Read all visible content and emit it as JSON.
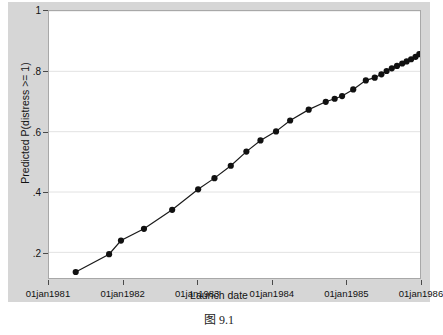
{
  "figure": {
    "caption": "图 9.1"
  },
  "chart_data": {
    "type": "line",
    "title": "",
    "xlabel": "Launch date",
    "ylabel": "Predicted P(distress >= 1)",
    "grid": true,
    "grid_axis": "y",
    "legend": "none",
    "marker": "filled-circle",
    "line_color": "#1a1a1a",
    "marker_color": "#111111",
    "xlim": [
      "01jan1981",
      "01jan1986"
    ],
    "ylim": [
      0.115,
      1.0
    ],
    "xtick_labels": [
      "01jan1981",
      "01jan1982",
      "01jan1983",
      "01jan1984",
      "01jan1985",
      "01jan1986"
    ],
    "xtick_positions": [
      1981.0,
      1982.0,
      1983.0,
      1984.0,
      1985.0,
      1986.0
    ],
    "ytick_labels": [
      ".2",
      ".4",
      ".6",
      ".8",
      "1"
    ],
    "ytick_values": [
      0.2,
      0.4,
      0.6,
      0.8,
      1.0
    ],
    "x": [
      1981.36,
      1981.81,
      1981.97,
      1982.28,
      1982.66,
      1983.01,
      1983.23,
      1983.45,
      1983.66,
      1983.85,
      1984.06,
      1984.25,
      1984.5,
      1984.73,
      1984.85,
      1984.95,
      1985.1,
      1985.27,
      1985.39,
      1985.48,
      1985.55,
      1985.62,
      1985.69,
      1985.76,
      1985.82,
      1985.88,
      1985.94,
      1985.99
    ],
    "y": [
      0.135,
      0.194,
      0.239,
      0.278,
      0.341,
      0.409,
      0.446,
      0.487,
      0.534,
      0.571,
      0.601,
      0.637,
      0.673,
      0.699,
      0.709,
      0.718,
      0.74,
      0.77,
      0.779,
      0.79,
      0.801,
      0.81,
      0.818,
      0.826,
      0.833,
      0.84,
      0.848,
      0.857
    ]
  }
}
